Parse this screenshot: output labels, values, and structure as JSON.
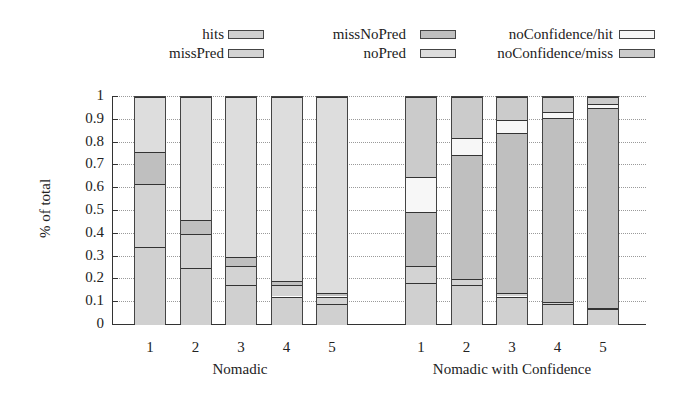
{
  "chart_data": {
    "type": "bar",
    "stacked": true,
    "title": "",
    "xlabel": "",
    "ylabel": "% of total",
    "ylim": [
      0,
      1
    ],
    "yticks": [
      "0",
      "0.1",
      "0.2",
      "0.3",
      "0.4",
      "0.5",
      "0.6",
      "0.7",
      "0.8",
      "0.9",
      "1"
    ],
    "grid": "horizontal dotted",
    "legend_position": "top",
    "legend": [
      {
        "name": "hits",
        "color": "#d0d0d0"
      },
      {
        "name": "missNoPred",
        "color": "#bfbfbf"
      },
      {
        "name": "noConfidence/hit",
        "color": "#f7f7f7"
      },
      {
        "name": "missPred",
        "color": "#d3d3d3"
      },
      {
        "name": "noPred",
        "color": "#dddddd"
      },
      {
        "name": "noConfidence/miss",
        "color": "#cbcbcb"
      }
    ],
    "series_order": [
      "hits",
      "missPred",
      "missNoPred",
      "noPred",
      "noConfidence/hit",
      "noConfidence/miss"
    ],
    "groups": [
      {
        "label": "Nomadic",
        "categories": [
          "1",
          "2",
          "3",
          "4",
          "5"
        ],
        "series": [
          {
            "name": "hits",
            "values": [
              0.34,
              0.25,
              0.175,
              0.125,
              0.09
            ]
          },
          {
            "name": "missPred",
            "values": [
              0.28,
              0.15,
              0.085,
              0.05,
              0.035
            ]
          },
          {
            "name": "missNoPred",
            "values": [
              0.14,
              0.06,
              0.04,
              0.02,
              0.015
            ]
          },
          {
            "name": "noPred",
            "values": [
              0.24,
              0.54,
              0.7,
              0.805,
              0.86
            ]
          },
          {
            "name": "noConfidence/hit",
            "values": [
              0,
              0,
              0,
              0,
              0
            ]
          },
          {
            "name": "noConfidence/miss",
            "values": [
              0,
              0,
              0,
              0,
              0
            ]
          }
        ]
      },
      {
        "label": "Nomadic with Confidence",
        "categories": [
          "1",
          "2",
          "3",
          "4",
          "5"
        ],
        "series": [
          {
            "name": "hits",
            "values": [
              0.185,
              0.175,
              0.125,
              0.09,
              0.068
            ]
          },
          {
            "name": "missPred",
            "values": [
              0.075,
              0.025,
              0.015,
              0.01,
              0.008
            ]
          },
          {
            "name": "missNoPred",
            "values": [
              0.235,
              0.545,
              0.7,
              0.81,
              0.875
            ]
          },
          {
            "name": "noPred",
            "values": [
              0,
              0,
              0,
              0,
              0
            ]
          },
          {
            "name": "noConfidence/hit",
            "values": [
              0.155,
              0.075,
              0.06,
              0.025,
              0.017
            ]
          },
          {
            "name": "noConfidence/miss",
            "values": [
              0.35,
              0.18,
              0.1,
              0.065,
              0.032
            ]
          }
        ]
      }
    ]
  }
}
